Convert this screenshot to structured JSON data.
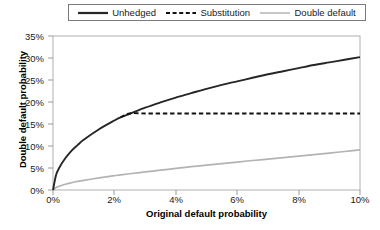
{
  "legend": {
    "position": "top",
    "entries": [
      {
        "label": "Unhedged",
        "style": "solid",
        "color": "#262626",
        "icon": "solid-line-icon"
      },
      {
        "label": "Substitution",
        "style": "dashed",
        "color": "#111111",
        "icon": "dashed-line-icon"
      },
      {
        "label": "Double default",
        "style": "solid",
        "color": "#b3b3b3",
        "icon": "gray-line-icon"
      }
    ]
  },
  "axes": {
    "y_title": "Double default probability",
    "x_title": "Original default probability",
    "y_ticks": [
      "0%",
      "5%",
      "10%",
      "15%",
      "20%",
      "25%",
      "30%",
      "35%"
    ],
    "x_ticks": [
      "0%",
      "2%",
      "4%",
      "6%",
      "8%",
      "10%"
    ]
  },
  "chart_data": {
    "type": "line",
    "title": "",
    "xlabel": "Original default probability",
    "ylabel": "Double default probability",
    "xlim": [
      0,
      10
    ],
    "ylim": [
      0,
      35
    ],
    "xunit": "%",
    "yunit": "%",
    "grid": false,
    "legend_position": "top",
    "x": [
      0,
      0.1,
      0.2,
      0.4,
      0.6,
      0.8,
      1.0,
      1.5,
      2.0,
      2.2,
      2.5,
      3.0,
      3.5,
      4.0,
      4.5,
      5.0,
      5.5,
      6.0,
      6.5,
      7.0,
      7.5,
      8.0,
      8.5,
      9.0,
      9.5,
      10.0
    ],
    "series": [
      {
        "name": "Unhedged",
        "color": "#262626",
        "style": "solid",
        "values": [
          0,
          3.4,
          5.0,
          7.2,
          8.9,
          10.2,
          11.4,
          13.8,
          15.8,
          16.5,
          17.3,
          18.7,
          19.9,
          21.0,
          22.0,
          23.0,
          23.9,
          24.7,
          25.5,
          26.3,
          27.0,
          27.7,
          28.4,
          29.0,
          29.6,
          30.2
        ]
      },
      {
        "name": "Substitution",
        "color": "#111111",
        "style": "dashed",
        "values": [
          0,
          3.4,
          5.0,
          7.2,
          8.9,
          10.2,
          11.4,
          13.8,
          15.8,
          16.5,
          17.4,
          17.4,
          17.4,
          17.4,
          17.4,
          17.4,
          17.4,
          17.4,
          17.4,
          17.4,
          17.4,
          17.4,
          17.4,
          17.4,
          17.4,
          17.4
        ]
      },
      {
        "name": "Double default",
        "color": "#b3b3b3",
        "style": "solid",
        "values": [
          0,
          0.55,
          0.85,
          1.3,
          1.65,
          1.95,
          2.2,
          2.75,
          3.25,
          3.45,
          3.7,
          4.1,
          4.5,
          4.9,
          5.3,
          5.65,
          6.0,
          6.35,
          6.7,
          7.0,
          7.35,
          7.7,
          8.05,
          8.4,
          8.75,
          9.1
        ]
      }
    ]
  },
  "colors": {
    "axis": "#9a9a9a",
    "frame": "#aaaaaa",
    "text": "#1a1a1a"
  }
}
